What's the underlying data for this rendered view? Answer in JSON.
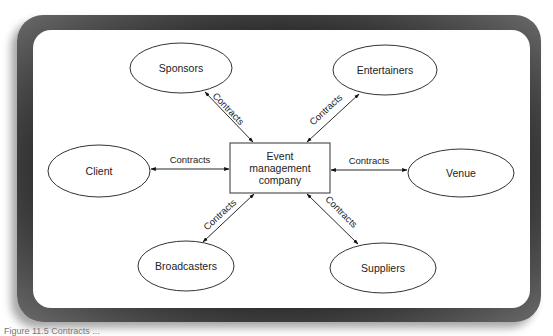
{
  "diagram": {
    "center": {
      "label_lines": [
        "Event",
        "management",
        "company"
      ]
    },
    "nodes": {
      "sponsors": "Sponsors",
      "entertainers": "Entertainers",
      "client": "Client",
      "venue": "Venue",
      "broadcasters": "Broadcasters",
      "suppliers": "Suppliers"
    },
    "edge_label": "Contracts",
    "edges": [
      {
        "from": "Event management company",
        "to": "Sponsors",
        "label": "Contracts"
      },
      {
        "from": "Event management company",
        "to": "Entertainers",
        "label": "Contracts"
      },
      {
        "from": "Event management company",
        "to": "Client",
        "label": "Contracts"
      },
      {
        "from": "Event management company",
        "to": "Venue",
        "label": "Contracts"
      },
      {
        "from": "Event management company",
        "to": "Broadcasters",
        "label": "Contracts"
      },
      {
        "from": "Event management company",
        "to": "Suppliers",
        "label": "Contracts"
      }
    ]
  },
  "caption": "Figure 11.5 Contracts ..."
}
